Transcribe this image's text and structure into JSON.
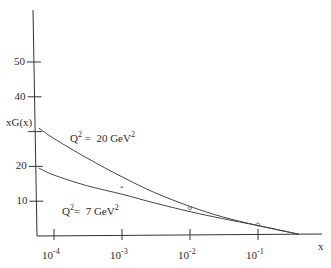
{
  "chart_data": {
    "type": "line",
    "title": "",
    "xlabel": "x",
    "ylabel": "xG(x)",
    "x_scale": "log",
    "xlim": [
      6e-05,
      0.6
    ],
    "ylim": [
      0,
      60
    ],
    "grid": false,
    "legend": "inline labels on curves",
    "x_ticks": [
      {
        "base": "10",
        "exp": "-4",
        "value": 0.0001
      },
      {
        "base": "10",
        "exp": "-3",
        "value": 0.001
      },
      {
        "base": "10",
        "exp": "-2",
        "value": 0.01
      },
      {
        "base": "10",
        "exp": "-1",
        "value": 0.1
      }
    ],
    "y_ticks": [
      {
        "label": "10",
        "value": 10
      },
      {
        "label": "20",
        "value": 20
      },
      {
        "label": "",
        "value": 30
      },
      {
        "label": "40",
        "value": 40
      },
      {
        "label": "50",
        "value": 50
      }
    ],
    "series": [
      {
        "name": "Q^2 = 20 GeV^2",
        "label_parts": {
          "q": "Q",
          "q_exp": "2",
          "rest": " =  20 GeV",
          "unit_exp": "2"
        },
        "x": [
          6e-05,
          0.0001,
          0.0003,
          0.001,
          0.003,
          0.01,
          0.03,
          0.1,
          0.4
        ],
        "y": [
          31,
          28,
          22.5,
          17,
          12.5,
          8.5,
          5.5,
          3,
          0.5
        ]
      },
      {
        "name": "Q^2 = 7 GeV^2",
        "label_parts": {
          "q": "Q",
          "q_exp": "2",
          "rest": "=  7 GeV",
          "unit_exp": "2"
        },
        "x": [
          6e-05,
          0.0001,
          0.0003,
          0.001,
          0.003,
          0.01,
          0.03,
          0.1,
          0.4
        ],
        "y": [
          19.5,
          17.5,
          14.5,
          12,
          9.5,
          7,
          5,
          3,
          0.5
        ]
      }
    ],
    "markers": [
      {
        "shape": "star",
        "x": 0.001,
        "y": 14
      },
      {
        "shape": "circle",
        "x": 0.01,
        "y": 8
      },
      {
        "shape": "circle",
        "x": 0.1,
        "y": 3.3
      }
    ]
  }
}
